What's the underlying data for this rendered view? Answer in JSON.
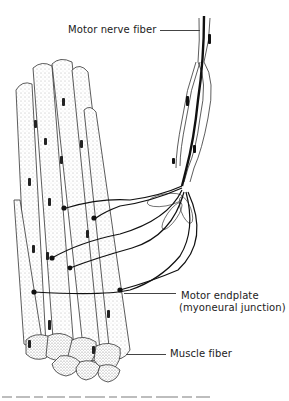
{
  "diagram": {
    "labels": {
      "motor_nerve_fiber": "Motor nerve fiber",
      "motor_endplate_line1": "Motor endplate",
      "motor_endplate_line2": "(myoneural junction)",
      "muscle_fiber": "Muscle fiber"
    },
    "nodes": [
      {
        "id": "nerve",
        "label": "Motor nerve fiber",
        "type": "myelinated axon"
      },
      {
        "id": "branches",
        "label": "Terminal axon branches",
        "count": 6
      },
      {
        "id": "endplate",
        "label": "Motor endplate (myoneural junction)"
      },
      {
        "id": "muscle",
        "label": "Muscle fiber",
        "type": "bundle of cylindrical fibers"
      }
    ],
    "edges": [
      {
        "from": "nerve",
        "to": "branches"
      },
      {
        "from": "branches",
        "to": "endplate"
      },
      {
        "from": "endplate",
        "to": "muscle"
      }
    ],
    "colors": {
      "ink": "#1a1a1a",
      "stipple": "#555555",
      "background": "#ffffff"
    }
  }
}
